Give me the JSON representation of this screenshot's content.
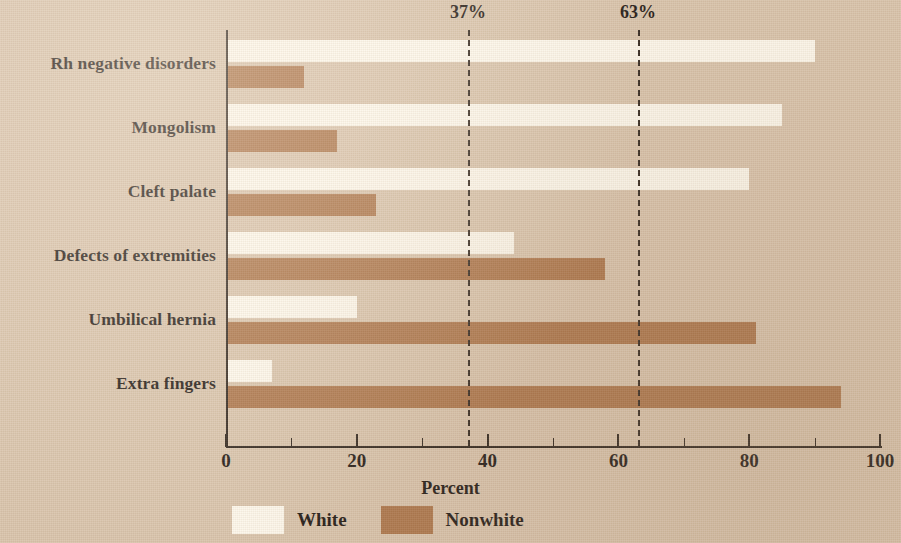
{
  "chart_data": {
    "type": "bar",
    "orientation": "horizontal",
    "title": "",
    "xlabel": "Percent",
    "ylabel": "",
    "xlim": [
      0,
      100
    ],
    "grid": false,
    "legend_position": "bottom-left",
    "categories": [
      "Rh negative disorders",
      "Mongolism",
      "Cleft palate",
      "Defects of extremities",
      "Umbilical hernia",
      "Extra fingers"
    ],
    "series": [
      {
        "name": "White",
        "color": "#fdf8ec",
        "values": [
          90,
          85,
          80,
          44,
          20,
          7
        ]
      },
      {
        "name": "Nonwhite",
        "color": "#ab7449",
        "values": [
          12,
          17,
          23,
          58,
          81,
          94
        ]
      }
    ],
    "x_ticks": [
      0,
      20,
      40,
      60,
      80,
      100
    ],
    "x_tick_labels": [
      "0",
      "20",
      "40",
      "60",
      "80",
      "100"
    ],
    "annotations": [
      {
        "name": "reference-37",
        "value": 37,
        "label": "37%",
        "style": "dashed"
      },
      {
        "name": "reference-63",
        "value": 63,
        "label": "63%",
        "style": "dashed"
      }
    ]
  },
  "legend": {
    "items": [
      {
        "label": "White"
      },
      {
        "label": "Nonwhite"
      }
    ]
  },
  "axis": {
    "x_title": "Percent"
  }
}
